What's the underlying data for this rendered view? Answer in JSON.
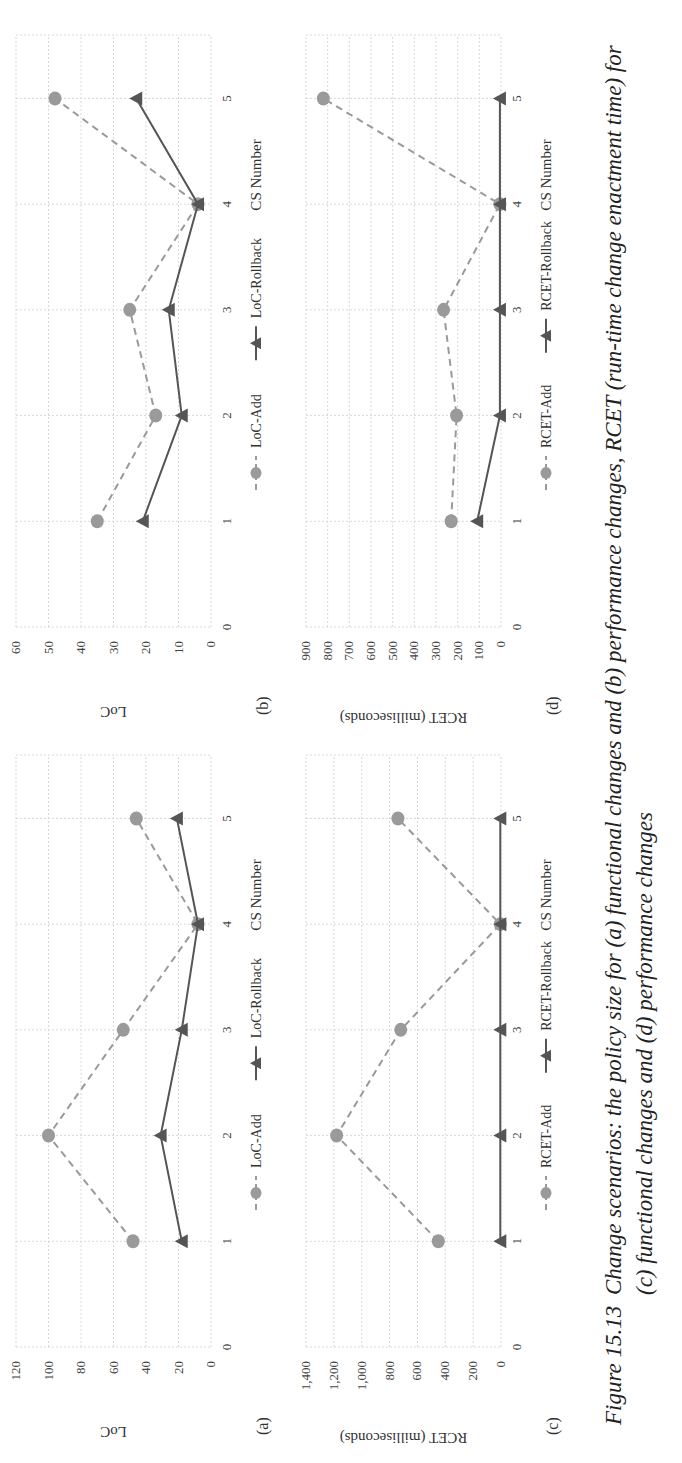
{
  "figure": {
    "number": "Figure 15.13",
    "caption": "Change scenarios: the policy size for (a) functional changes and (b) performance changes, RCET (run-time change enactment time) for (c) functional changes and (d) performance changes"
  },
  "colors": {
    "add_series": "#9a9a9a",
    "rollback_series": "#555555",
    "grid": "#d8d8d8"
  },
  "chart_data": [
    {
      "panel": "(a)",
      "type": "line",
      "title": "",
      "xlabel": "CS Number",
      "ylabel": "LoC",
      "x": [
        1,
        2,
        3,
        4,
        5
      ],
      "x_ticks": [
        "0",
        "1",
        "2",
        "3",
        "4",
        "5"
      ],
      "y_ticks": [
        "0",
        "20",
        "40",
        "60",
        "80",
        "100",
        "120"
      ],
      "ylim": [
        0,
        120
      ],
      "grid": true,
      "legend_position": "bottom",
      "series": [
        {
          "name": "LoC-Add",
          "style": "dashed",
          "marker": "circle",
          "values": [
            48,
            100,
            54,
            8,
            46
          ]
        },
        {
          "name": "LoC-Rollback",
          "style": "solid",
          "marker": "triangle",
          "values": [
            18,
            31,
            18,
            8,
            21
          ]
        }
      ]
    },
    {
      "panel": "(b)",
      "type": "line",
      "title": "",
      "xlabel": "CS Number",
      "ylabel": "LoC",
      "x": [
        1,
        2,
        3,
        4,
        5
      ],
      "x_ticks": [
        "0",
        "1",
        "2",
        "3",
        "4",
        "5"
      ],
      "y_ticks": [
        "0",
        "10",
        "20",
        "30",
        "40",
        "50",
        "60"
      ],
      "ylim": [
        0,
        60
      ],
      "grid": true,
      "legend_position": "bottom",
      "series": [
        {
          "name": "LoC-Add",
          "style": "dashed",
          "marker": "circle",
          "values": [
            35,
            17,
            25,
            4,
            48
          ]
        },
        {
          "name": "LoC-Rollback",
          "style": "solid",
          "marker": "triangle",
          "values": [
            21,
            9,
            13,
            4,
            23
          ]
        }
      ]
    },
    {
      "panel": "(c)",
      "type": "line",
      "title": "",
      "xlabel": "CS Number",
      "ylabel": "RCET (milliseconds)",
      "x": [
        1,
        2,
        3,
        4,
        5
      ],
      "x_ticks": [
        "0",
        "1",
        "2",
        "3",
        "4",
        "5"
      ],
      "y_ticks": [
        "0",
        "200",
        "400",
        "600",
        "800",
        "1,000",
        "1,200",
        "1,400"
      ],
      "ylim": [
        0,
        1400
      ],
      "grid": true,
      "legend_position": "bottom",
      "series": [
        {
          "name": "RCET-Add",
          "style": "dashed",
          "marker": "circle",
          "values": [
            450,
            1180,
            720,
            5,
            740
          ]
        },
        {
          "name": "RCET-Rollback",
          "style": "solid",
          "marker": "triangle",
          "values": [
            5,
            5,
            5,
            5,
            5
          ]
        }
      ]
    },
    {
      "panel": "(d)",
      "type": "line",
      "title": "",
      "xlabel": "CS Number",
      "ylabel": "RCET (milliseconds)",
      "x": [
        1,
        2,
        3,
        4,
        5
      ],
      "x_ticks": [
        "0",
        "1",
        "2",
        "3",
        "4",
        "5"
      ],
      "y_ticks": [
        "0",
        "100",
        "200",
        "300",
        "400",
        "500",
        "600",
        "700",
        "800",
        "900"
      ],
      "ylim": [
        0,
        900
      ],
      "grid": true,
      "legend_position": "bottom",
      "series": [
        {
          "name": "RCET-Add",
          "style": "dashed",
          "marker": "circle",
          "values": [
            230,
            205,
            265,
            5,
            820
          ]
        },
        {
          "name": "RCET-Rollback",
          "style": "solid",
          "marker": "triangle",
          "values": [
            110,
            5,
            5,
            5,
            5
          ]
        }
      ]
    }
  ]
}
